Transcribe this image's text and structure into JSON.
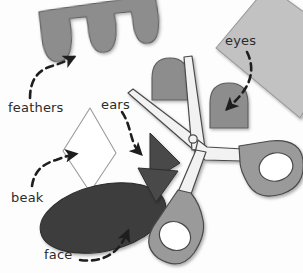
{
  "scene": {
    "title": "Owl craft cut-out pieces with scissors",
    "width": 303,
    "height": 273,
    "background": "#fdfdfd"
  },
  "labels": [
    {
      "id": "feathers",
      "text": "feathers"
    },
    {
      "id": "ears",
      "text": "ears"
    },
    {
      "id": "eyes",
      "text": "eyes"
    },
    {
      "id": "beak",
      "text": "beak"
    },
    {
      "id": "face",
      "text": "face"
    }
  ],
  "colors": {
    "feathers_fill": "#8d8d8d",
    "feathers_stroke": "#5d5d5d",
    "paper_fill": "#c2c2c2",
    "paper_stroke": "#9a9a9a",
    "eye_fill": "#8d8d8d",
    "eye_stroke": "#5d5d5d",
    "ear_fill": "#4a4a4a",
    "ear_stroke": "#2e2e2e",
    "beak_fill": "#ffffff",
    "beak_stroke": "#9c9c9c",
    "face_fill": "#3c3c3c",
    "face_stroke": "#2a2a2a",
    "scissors_blade_fill": "#f2f2f2",
    "scissors_blade_stroke": "#4a4a4a",
    "scissors_handle_fill": "#9a9a9a",
    "scissors_handle_stroke": "#4a4a4a",
    "arrow": "#1e1e1e",
    "label_text": "#2b2b2b"
  },
  "shapes": [
    {
      "name": "feathers-strip",
      "kind": "scalloped-strip",
      "label": "feathers"
    },
    {
      "name": "paper-sheet",
      "kind": "rotated-square",
      "label": "eyes"
    },
    {
      "name": "eye-piece-left",
      "kind": "dome",
      "label": "eyes"
    },
    {
      "name": "eye-piece-right",
      "kind": "dome",
      "label": "eyes"
    },
    {
      "name": "ear-triangle-right",
      "kind": "triangle",
      "label": "ears"
    },
    {
      "name": "ear-triangle-down",
      "kind": "triangle",
      "label": "ears"
    },
    {
      "name": "beak-diamond",
      "kind": "rhombus",
      "label": "beak"
    },
    {
      "name": "face-oval",
      "kind": "ellipse",
      "label": "face"
    },
    {
      "name": "scissors",
      "kind": "tool",
      "label": ""
    }
  ],
  "arrows": [
    {
      "name": "arrow-to-feathers",
      "from": "feathers",
      "points_to": "feathers-strip"
    },
    {
      "name": "arrow-to-ears",
      "from": "ears",
      "points_to": "ear-triangle-right"
    },
    {
      "name": "arrow-to-eyes",
      "from": "eyes",
      "points_to": "eye-piece-right"
    },
    {
      "name": "arrow-to-beak",
      "from": "beak",
      "points_to": "beak-diamond"
    },
    {
      "name": "arrow-to-face",
      "from": "face",
      "points_to": "face-oval"
    }
  ]
}
